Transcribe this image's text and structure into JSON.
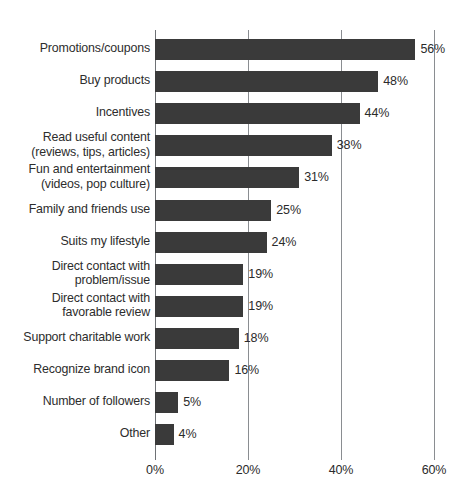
{
  "chart_data": {
    "type": "bar",
    "orientation": "horizontal",
    "title": "",
    "subtitle": "",
    "xlabel": "",
    "ylabel": "",
    "xlim": [
      0,
      60
    ],
    "x_tick_labels": [
      "0%",
      "20%",
      "40%",
      "60%"
    ],
    "x_ticks": [
      0,
      20,
      40,
      60
    ],
    "grid": "vertical",
    "legend": "none",
    "value_suffix": "%",
    "bar_color": "#3a3a3a",
    "label_color": "#2d2d2d",
    "gridline_color": "#8a8d91",
    "background_color": "#ffffff",
    "categories": [
      "Promotions/coupons",
      "Buy products",
      "Incentives",
      "Read useful content\n(reviews, tips, articles)",
      "Fun and entertainment\n(videos, pop culture)",
      "Family and friends use",
      "Suits my lifestyle",
      "Direct contact with\nproblem/issue",
      "Direct contact with\nfavorable review",
      "Support charitable work",
      "Recognize brand icon",
      "Number of followers",
      "Other"
    ],
    "values": [
      56,
      48,
      44,
      38,
      31,
      25,
      24,
      19,
      19,
      18,
      16,
      5,
      4
    ],
    "value_labels": [
      "56%",
      "48%",
      "44%",
      "38%",
      "31%",
      "25%",
      "24%",
      "19%",
      "19%",
      "18%",
      "16%",
      "5%",
      "4%"
    ]
  }
}
